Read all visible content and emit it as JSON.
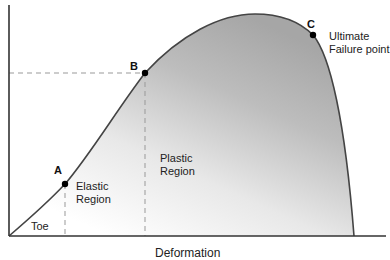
{
  "diagram": {
    "type": "stress-strain curve",
    "x_axis_label": "Deformation",
    "points": [
      {
        "id": "A",
        "label": "A"
      },
      {
        "id": "B",
        "label": "B"
      },
      {
        "id": "C",
        "label": "C"
      }
    ],
    "regions": {
      "toe": "Toe",
      "elastic_line1": "Elastic",
      "elastic_line2": "Region",
      "plastic_line1": "Plastic",
      "plastic_line2": "Region"
    },
    "annotations": {
      "ultimate_line1": "Ultimate",
      "ultimate_line2": "Failure point"
    },
    "colors": {
      "curve": "#444444",
      "axis": "#333333",
      "fill_dark": "#a8a8a8",
      "fill_light": "#ffffff",
      "dashed": "#999999",
      "point": "#000000"
    }
  }
}
